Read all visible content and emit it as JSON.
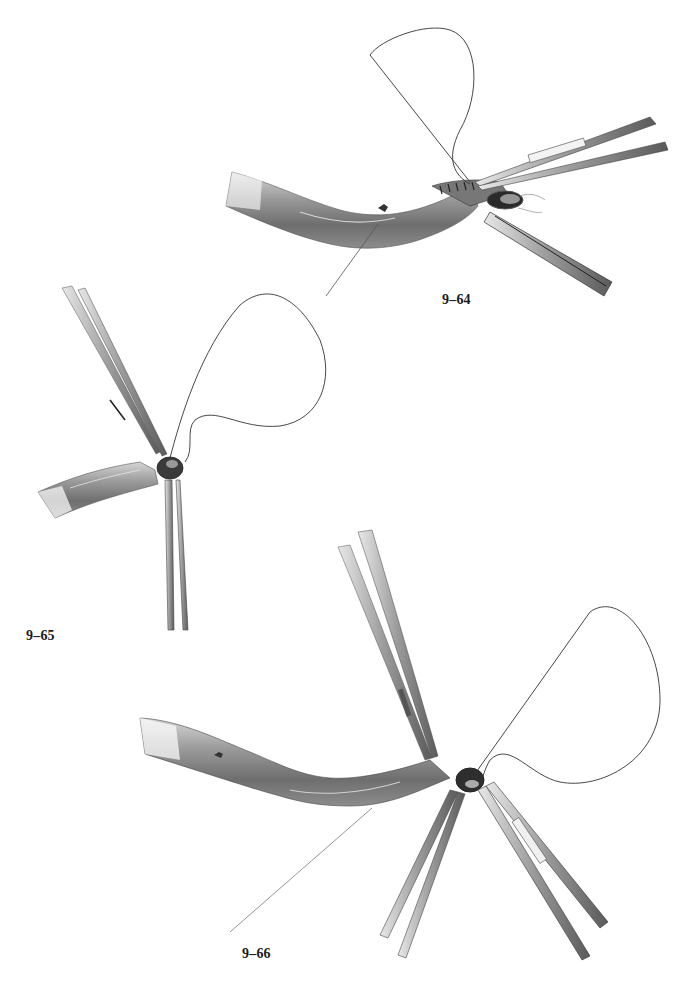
{
  "page": {
    "background": "#ffffff",
    "ink_color": "#1a1a1a"
  },
  "figures": [
    {
      "id": "fig-9-64",
      "label": "9–64",
      "depicts": "vessel anastomosis with running suture, forceps and needle holder at open end"
    },
    {
      "id": "fig-9-65",
      "label": "9–65",
      "depicts": "vessel end held by forceps with suture loop passing through"
    },
    {
      "id": "fig-9-66",
      "label": "9–66",
      "depicts": "curved vessel with anastomosis, three instruments and suture loop"
    }
  ]
}
